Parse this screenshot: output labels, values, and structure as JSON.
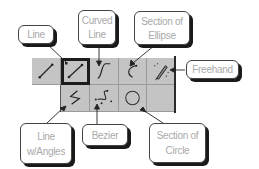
{
  "diagram": {
    "colors": {
      "cell_bg": "#c4c4c4",
      "callout_text": "#a9a9a9",
      "callout_border": "#444444",
      "shadow": "#1a1a1a",
      "selected_border": "#1c1c1c"
    },
    "tools": [
      {
        "id": "line",
        "icon": "straight-line-icon",
        "row": 1,
        "col": 1,
        "selected": false
      },
      {
        "id": "line-selected",
        "icon": "straight-line-icon",
        "row": 1,
        "col": 2,
        "selected": true
      },
      {
        "id": "curved-line",
        "icon": "curved-line-icon",
        "row": 1,
        "col": 3,
        "selected": false
      },
      {
        "id": "section-of-ellipse",
        "icon": "ellipse-arc-icon",
        "row": 1,
        "col": 4,
        "selected": false
      },
      {
        "id": "freehand",
        "icon": "pencil-icon",
        "row": 1,
        "col": 5,
        "selected": false
      },
      {
        "id": "line-with-angles",
        "icon": "polyline-icon",
        "row": 2,
        "col": 2,
        "selected": false
      },
      {
        "id": "bezier",
        "icon": "bezier-icon",
        "row": 2,
        "col": 3,
        "selected": false
      },
      {
        "id": "section-of-circle",
        "icon": "circle-icon",
        "row": 2,
        "col": 4,
        "selected": false
      },
      {
        "id": "empty",
        "icon": "",
        "row": 2,
        "col": 5,
        "selected": false
      }
    ],
    "callouts": {
      "line": {
        "line1": "Line",
        "line2": ""
      },
      "curved_line": {
        "line1": "Curved",
        "line2": "Line"
      },
      "section_of_ellipse": {
        "line1": "Section of",
        "line2": "Ellipse"
      },
      "freehand": {
        "line1": "Freehand",
        "line2": ""
      },
      "line_with_angles": {
        "line1": "Line",
        "line2": "w/Angles"
      },
      "bezier": {
        "line1": "Bezier",
        "line2": ""
      },
      "section_of_circle": {
        "line1": "Section of",
        "line2": "Circle"
      }
    }
  }
}
